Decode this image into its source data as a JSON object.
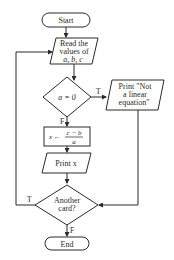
{
  "flowchart": {
    "start": {
      "label": "Start"
    },
    "read": {
      "lines": [
        "Read the",
        "values of",
        "a, b, c"
      ]
    },
    "decision1": {
      "label": "a = 0",
      "true_label": "T",
      "false_label": "F"
    },
    "print_error": {
      "lines": [
        "Print \"Not",
        "a linear",
        "equation\""
      ]
    },
    "assign": {
      "lhs": "x ←",
      "numerator": "c − b",
      "denominator": "a"
    },
    "print_x": {
      "label": "Print x"
    },
    "decision2": {
      "lines": [
        "Another",
        "card?"
      ],
      "true_label": "T",
      "false_label": "F"
    },
    "end": {
      "label": "End"
    }
  }
}
